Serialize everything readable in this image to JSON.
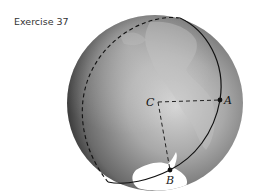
{
  "title": "Exercise 37",
  "diagram": {
    "type": "globe-great-circle",
    "points": {
      "C": {
        "label": "C",
        "role": "center"
      },
      "A": {
        "label": "A",
        "role": "point-on-great-circle"
      },
      "B": {
        "label": "B",
        "role": "point-on-great-circle"
      }
    },
    "segments": [
      {
        "from": "C",
        "to": "A",
        "style": "dashed"
      },
      {
        "from": "C",
        "to": "B",
        "style": "dashed"
      }
    ],
    "great_circle": {
      "front": "solid",
      "back": "dashed"
    },
    "colors": {
      "globe_light": "#d6d6d6",
      "globe_dark": "#3c3c3c",
      "line": "#111111",
      "land": "#ffffff"
    }
  }
}
